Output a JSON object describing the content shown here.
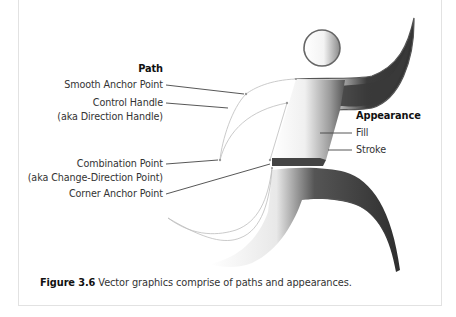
{
  "figure": {
    "path_section": {
      "heading": "Path",
      "labels": [
        {
          "line1": "Smooth Anchor Point",
          "line2": ""
        },
        {
          "line1": "Control Handle",
          "line2": "(aka Direction Handle)"
        },
        {
          "line1": "Combination Point",
          "line2": "(aka Change-Direction Point)"
        },
        {
          "line1": "Corner Anchor Point",
          "line2": ""
        }
      ]
    },
    "appearance_section": {
      "heading": "Appearance",
      "labels": [
        "Fill",
        "Stroke"
      ]
    },
    "caption": {
      "number": "Figure 3.6",
      "text": " Vector graphics comprise of paths and appearances."
    },
    "illustration": {
      "subject": "running-figure",
      "colors": {
        "dark_fill": "#3a3a3a",
        "stroke": "#555555",
        "path_line": "#bdbdbd",
        "leader_line": "#444444"
      }
    }
  }
}
